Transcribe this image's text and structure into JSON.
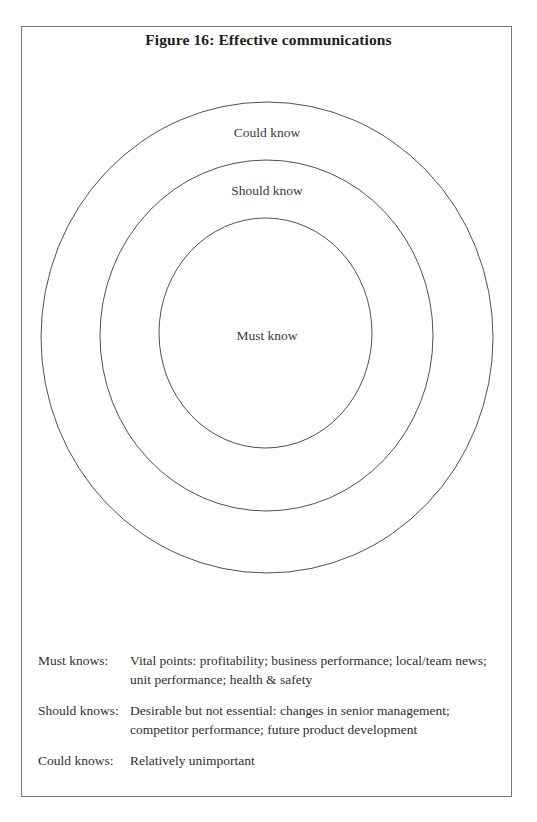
{
  "figure": {
    "title": "Figure 16: Effective communications"
  },
  "diagram": {
    "type": "concentric-circles",
    "stroke_color": "#3c3c3c",
    "rings": [
      {
        "label": "Could know",
        "cx": 267,
        "cy": 337.5,
        "rx": 226,
        "ry": 235.5,
        "label_x": 267,
        "label_y": 125
      },
      {
        "label": "Should know",
        "cx": 266.5,
        "cy": 335.5,
        "rx": 166.5,
        "ry": 175.5,
        "label_x": 267,
        "label_y": 183
      },
      {
        "label": "Must know",
        "cx": 265.5,
        "cy": 333,
        "rx": 106.5,
        "ry": 115,
        "label_x": 267,
        "label_y": 328
      }
    ]
  },
  "legend": [
    {
      "label": "Must knows:",
      "description": "Vital points: profitability; business performance; local/team news; unit performance; health & safety"
    },
    {
      "label": "Should knows:",
      "description": "Desirable but not essential: changes in senior management; competitor performance; future product development"
    },
    {
      "label": "Could knows:",
      "description": "Relatively unimportant"
    }
  ]
}
